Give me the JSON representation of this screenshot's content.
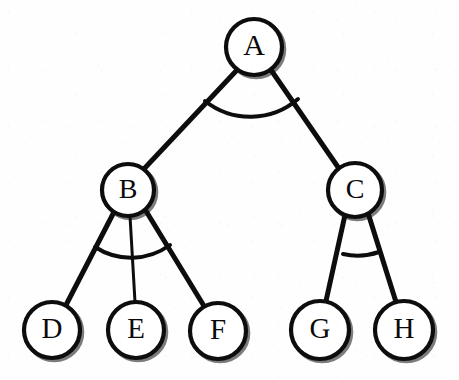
{
  "figure": {
    "background_color": "#fefefe",
    "stroke_color": "#0d0d0d",
    "node_fill_color": "#ffffff",
    "label_color": "#0a0a0a",
    "width": 459,
    "height": 380
  },
  "nodes": [
    {
      "id": "A",
      "label": "A",
      "cx": 254,
      "cy": 47,
      "r": 28,
      "font_size": 30,
      "level": 0
    },
    {
      "id": "B",
      "label": "B",
      "cx": 128,
      "cy": 190,
      "r": 26,
      "font_size": 28,
      "level": 1
    },
    {
      "id": "C",
      "label": "C",
      "cx": 355,
      "cy": 190,
      "r": 27,
      "font_size": 28,
      "level": 1
    },
    {
      "id": "D",
      "label": "D",
      "cx": 52,
      "cy": 330,
      "r": 28,
      "font_size": 29,
      "level": 2
    },
    {
      "id": "E",
      "label": "E",
      "cx": 136,
      "cy": 330,
      "r": 28,
      "font_size": 29,
      "level": 2
    },
    {
      "id": "F",
      "label": "F",
      "cx": 218,
      "cy": 331,
      "r": 28,
      "font_size": 29,
      "level": 2
    },
    {
      "id": "G",
      "label": "G",
      "cx": 320,
      "cy": 330,
      "r": 29,
      "font_size": 29,
      "level": 2
    },
    {
      "id": "H",
      "label": "H",
      "cx": 404,
      "cy": 330,
      "r": 29,
      "font_size": 29,
      "level": 2
    }
  ],
  "edges": [
    {
      "id": "A-B",
      "from": "A",
      "to": "B",
      "x1": 237,
      "y1": 70,
      "x2": 142,
      "y2": 171,
      "width": 5
    },
    {
      "id": "A-C",
      "from": "A",
      "to": "C",
      "x1": 271,
      "y1": 70,
      "x2": 340,
      "y2": 170,
      "width": 5
    },
    {
      "id": "B-D",
      "from": "B",
      "to": "D",
      "x1": 114,
      "y1": 212,
      "x2": 66,
      "y2": 305,
      "width": 5
    },
    {
      "id": "B-E",
      "from": "B",
      "to": "E",
      "x1": 130,
      "y1": 216,
      "x2": 135,
      "y2": 302,
      "width": 3
    },
    {
      "id": "B-F",
      "from": "B",
      "to": "F",
      "x1": 146,
      "y1": 211,
      "x2": 204,
      "y2": 306,
      "width": 5
    },
    {
      "id": "C-G",
      "from": "C",
      "to": "G",
      "x1": 345,
      "y1": 215,
      "x2": 326,
      "y2": 301,
      "width": 5
    },
    {
      "id": "C-H",
      "from": "C",
      "to": "H",
      "x1": 368,
      "y1": 213,
      "x2": 396,
      "y2": 302,
      "width": 5
    }
  ],
  "angle_arcs": [
    {
      "id": "arc-A",
      "at_node": "A",
      "cx": 254,
      "cy": 47,
      "r": 73,
      "start_x": 205,
      "start_y": 101,
      "end_x": 298,
      "end_y": 99,
      "width": 4
    },
    {
      "id": "arc-B",
      "at_node": "B",
      "cx": 128,
      "cy": 190,
      "r": 66,
      "start_x": 95,
      "start_y": 247,
      "end_x": 170,
      "end_y": 245,
      "width": 4
    },
    {
      "id": "arc-C",
      "at_node": "C",
      "cx": 355,
      "cy": 190,
      "r": 65,
      "start_x": 343,
      "start_y": 254,
      "end_x": 379,
      "end_y": 252,
      "width": 4
    }
  ],
  "chart_data": {
    "type": "diagram",
    "structure": "tree",
    "root": "A",
    "node_labels": [
      "A",
      "B",
      "C",
      "D",
      "E",
      "F",
      "G",
      "H"
    ],
    "adjacency": {
      "A": [
        "B",
        "C"
      ],
      "B": [
        "D",
        "E",
        "F"
      ],
      "C": [
        "G",
        "H"
      ],
      "D": [],
      "E": [],
      "F": [],
      "G": [],
      "H": []
    },
    "edge_list": [
      [
        "A",
        "B"
      ],
      [
        "A",
        "C"
      ],
      [
        "B",
        "D"
      ],
      [
        "B",
        "E"
      ],
      [
        "B",
        "F"
      ],
      [
        "C",
        "G"
      ],
      [
        "C",
        "H"
      ]
    ],
    "depths": {
      "A": 0,
      "B": 1,
      "C": 1,
      "D": 2,
      "E": 2,
      "F": 2,
      "G": 2,
      "H": 2
    },
    "node_count": 8,
    "edge_count": 7,
    "leaf_nodes": [
      "D",
      "E",
      "F",
      "G",
      "H"
    ],
    "internal_nodes": [
      "A",
      "B",
      "C"
    ],
    "angle_markers_at": [
      "A",
      "B",
      "C"
    ],
    "legend": [],
    "xlabel": "",
    "ylabel": ""
  }
}
